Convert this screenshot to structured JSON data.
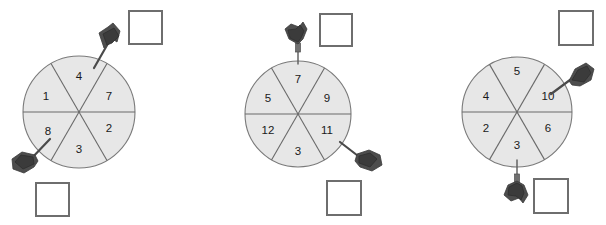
{
  "page": {
    "background_color": "#ffffff",
    "problem_count": 3
  },
  "style": {
    "wheel_fill": "#e7e7e7",
    "wheel_stroke": "#7a7a7a",
    "spoke_color": "#6a6a6a",
    "label_color": "#1a1a1a",
    "box_stroke": "#6e6e6e",
    "box_fill": "#ffffff",
    "dart_color": "#4a4a4a"
  },
  "spinners": [
    {
      "id": "spinner-1",
      "center_x": 79,
      "center_y": 112,
      "radius": 56,
      "sector_count": 6,
      "sectors": [
        {
          "position": "top",
          "label": "4",
          "angle_deg": 270,
          "label_x": 79,
          "label_y": 77
        },
        {
          "position": "upper-right",
          "label": "7",
          "angle_deg": 330,
          "label_x": 109,
          "label_y": 97
        },
        {
          "position": "lower-right",
          "label": "2",
          "angle_deg": 30,
          "label_x": 109,
          "label_y": 129
        },
        {
          "position": "bottom",
          "label": "3",
          "angle_deg": 90,
          "label_x": 79,
          "label_y": 150
        },
        {
          "position": "lower-left",
          "label": "8",
          "angle_deg": 150,
          "label_x": 48,
          "label_y": 132
        },
        {
          "position": "upper-left",
          "label": "1",
          "angle_deg": 210,
          "label_x": 46,
          "label_y": 97
        }
      ],
      "darts": [
        {
          "id": "dart-top",
          "points_to": "4",
          "tip_x": 94,
          "tip_y": 68,
          "tail_x": 112,
          "tail_y": 34,
          "direction": "down-left"
        },
        {
          "id": "dart-bottom-left",
          "points_to": "8",
          "tip_x": 50,
          "tip_y": 139,
          "tail_x": 22,
          "tail_y": 170,
          "direction": "up-right"
        }
      ],
      "answer_boxes": [
        {
          "id": "answer-box-top",
          "x": 129,
          "y": 11,
          "size": 33,
          "value": ""
        },
        {
          "id": "answer-box-bottom",
          "x": 36,
          "y": 183,
          "size": 33,
          "value": ""
        }
      ]
    },
    {
      "id": "spinner-2",
      "center_x": 298,
      "center_y": 114,
      "radius": 53,
      "sector_count": 6,
      "sectors": [
        {
          "position": "top",
          "label": "7",
          "angle_deg": 270,
          "label_x": 298,
          "label_y": 80
        },
        {
          "position": "upper-right",
          "label": "9",
          "angle_deg": 330,
          "label_x": 327,
          "label_y": 99
        },
        {
          "position": "lower-right",
          "label": "11",
          "angle_deg": 30,
          "label_x": 327,
          "label_y": 131
        },
        {
          "position": "bottom",
          "label": "3",
          "angle_deg": 90,
          "label_x": 298,
          "label_y": 152
        },
        {
          "position": "lower-left",
          "label": "12",
          "angle_deg": 150,
          "label_x": 268,
          "label_y": 131
        },
        {
          "position": "upper-left",
          "label": "5",
          "angle_deg": 210,
          "label_x": 268,
          "label_y": 99
        }
      ],
      "darts": [
        {
          "id": "dart-top",
          "points_to": "7",
          "tip_x": 298,
          "tip_y": 64,
          "tail_x": 298,
          "tail_y": 26,
          "direction": "down"
        },
        {
          "id": "dart-bottom-right",
          "points_to": "11",
          "tip_x": 340,
          "tip_y": 142,
          "tail_x": 375,
          "tail_y": 168,
          "direction": "up-left"
        }
      ],
      "answer_boxes": [
        {
          "id": "answer-box-top",
          "x": 320,
          "y": 14,
          "size": 32,
          "value": ""
        },
        {
          "id": "answer-box-bottom",
          "x": 327,
          "y": 181,
          "size": 34,
          "value": ""
        }
      ]
    },
    {
      "id": "spinner-3",
      "center_x": 517,
      "center_y": 112,
      "radius": 55,
      "sector_count": 6,
      "sectors": [
        {
          "position": "top",
          "label": "5",
          "angle_deg": 270,
          "label_x": 517,
          "label_y": 72
        },
        {
          "position": "upper-right",
          "label": "10",
          "angle_deg": 330,
          "label_x": 548,
          "label_y": 97
        },
        {
          "position": "lower-right",
          "label": "6",
          "angle_deg": 30,
          "label_x": 548,
          "label_y": 129
        },
        {
          "position": "bottom",
          "label": "3",
          "angle_deg": 90,
          "label_x": 517,
          "label_y": 146
        },
        {
          "position": "lower-left",
          "label": "2",
          "angle_deg": 150,
          "label_x": 486,
          "label_y": 129
        },
        {
          "position": "upper-left",
          "label": "4",
          "angle_deg": 210,
          "label_x": 486,
          "label_y": 97
        }
      ],
      "darts": [
        {
          "id": "dart-upper-right",
          "points_to": "10",
          "tip_x": 551,
          "tip_y": 94,
          "tail_x": 588,
          "tail_y": 64,
          "direction": "down-left"
        },
        {
          "id": "dart-bottom",
          "points_to": "3",
          "tip_x": 517,
          "tip_y": 160,
          "tail_x": 517,
          "tail_y": 196,
          "direction": "up"
        }
      ],
      "answer_boxes": [
        {
          "id": "answer-box-top",
          "x": 559,
          "y": 11,
          "size": 34,
          "value": ""
        },
        {
          "id": "answer-box-bottom",
          "x": 534,
          "y": 179,
          "size": 34,
          "value": ""
        }
      ]
    }
  ]
}
